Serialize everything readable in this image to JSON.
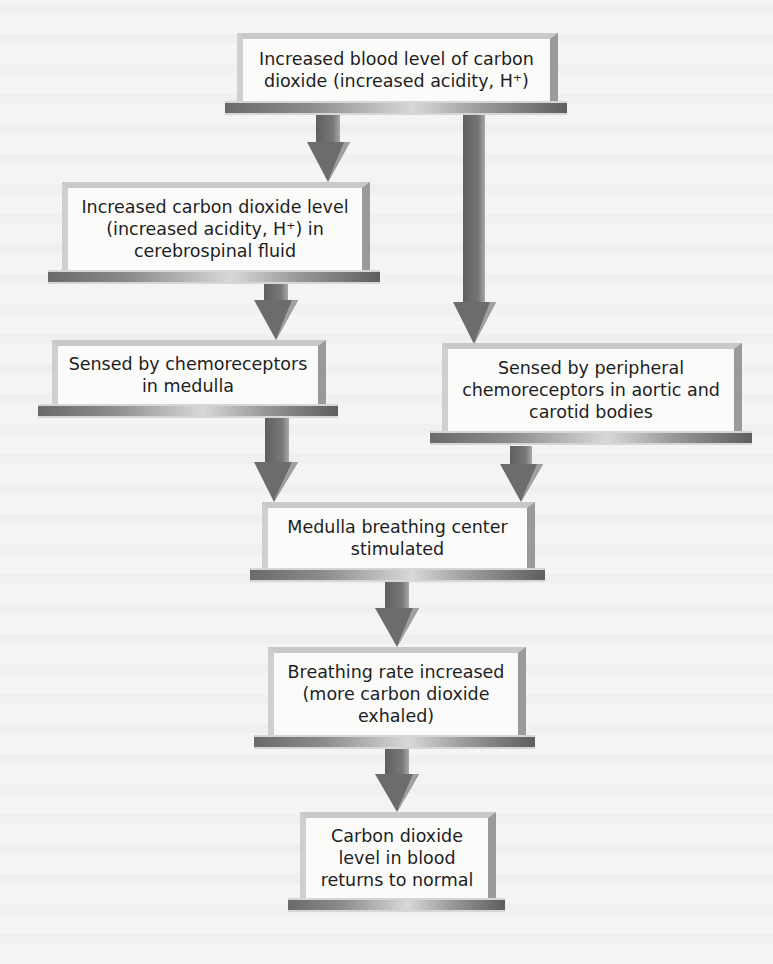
{
  "diagram": {
    "title": "",
    "type": "flowchart",
    "nodes": [
      {
        "id": "n1",
        "label": "Increased blood level of carbon\ndioxide (increased acidity, H⁺)"
      },
      {
        "id": "n2",
        "label": "Increased carbon dioxide level\n(increased acidity, H⁺) in\ncerebrospinal fluid"
      },
      {
        "id": "n3",
        "label": "Sensed by chemoreceptors\nin medulla"
      },
      {
        "id": "n4",
        "label": "Sensed by peripheral\nchemoreceptors in aortic and\ncarotid bodies"
      },
      {
        "id": "n5",
        "label": "Medulla  breathing center\nstimulated"
      },
      {
        "id": "n6",
        "label": "Breathing rate increased\n(more carbon dioxide\nexhaled)"
      },
      {
        "id": "n7",
        "label": "Carbon dioxide\nlevel in blood\nreturns to normal"
      }
    ],
    "edges": [
      {
        "from": "n1",
        "to": "n2"
      },
      {
        "from": "n1",
        "to": "n4"
      },
      {
        "from": "n2",
        "to": "n3"
      },
      {
        "from": "n3",
        "to": "n5"
      },
      {
        "from": "n4",
        "to": "n5"
      },
      {
        "from": "n5",
        "to": "n6"
      },
      {
        "from": "n6",
        "to": "n7"
      }
    ],
    "colors": {
      "arrow": "#6f6f6f",
      "box_fill": "#fbfbfa",
      "box_frame": "#c9c9c9",
      "background": "#f4f4f2"
    }
  }
}
